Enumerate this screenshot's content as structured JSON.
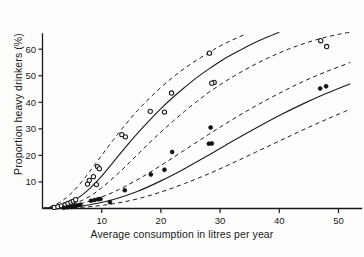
{
  "figure": {
    "xlabel": "Average consumption in litres per year",
    "ylabel": "Proportion heavy drinkers (%)",
    "caption": ""
  },
  "chart_data": {
    "type": "scatter",
    "title": "",
    "subtitle": "",
    "xlabel": "Average consumption in litres per year",
    "ylabel": "Proportion heavy drinkers (%)",
    "xlim": [
      0,
      54
    ],
    "ylim": [
      0,
      66
    ],
    "xticks": [
      10,
      20,
      30,
      40,
      50
    ],
    "yticks": [
      10,
      20,
      30,
      40,
      50,
      60
    ],
    "grid": false,
    "legend": "none",
    "axis_color": "#1a1a1a",
    "series": [
      {
        "name": "open-circles",
        "marker": "open-circle",
        "color": "#1a1a1a",
        "points": [
          [
            2.0,
            0.4
          ],
          [
            2.6,
            0.7
          ],
          [
            3.2,
            1.0
          ],
          [
            3.8,
            1.4
          ],
          [
            4.3,
            1.9
          ],
          [
            4.8,
            2.4
          ],
          [
            5.2,
            2.8
          ],
          [
            5.6,
            3.3
          ],
          [
            7.6,
            9.2
          ],
          [
            7.9,
            10.6
          ],
          [
            8.6,
            12.0
          ],
          [
            9.1,
            9.0
          ],
          [
            9.3,
            15.8
          ],
          [
            9.6,
            15.0
          ],
          [
            13.4,
            27.8
          ],
          [
            14.0,
            27.0
          ],
          [
            18.2,
            36.6
          ],
          [
            20.6,
            36.3
          ],
          [
            21.8,
            43.5
          ],
          [
            28.2,
            58.5
          ],
          [
            29.0,
            47.5
          ],
          [
            28.6,
            47.2
          ],
          [
            47.0,
            63.2
          ],
          [
            48.0,
            61.0
          ]
        ]
      },
      {
        "name": "filled-circles",
        "marker": "filled-circle",
        "color": "#111111",
        "points": [
          [
            3.6,
            0.3
          ],
          [
            4.2,
            0.5
          ],
          [
            4.8,
            0.6
          ],
          [
            5.2,
            0.8
          ],
          [
            5.6,
            1.0
          ],
          [
            6.0,
            1.2
          ],
          [
            6.4,
            1.4
          ],
          [
            8.2,
            2.9
          ],
          [
            8.8,
            3.2
          ],
          [
            9.4,
            3.5
          ],
          [
            9.8,
            3.6
          ],
          [
            11.4,
            2.4
          ],
          [
            13.9,
            6.9
          ],
          [
            18.3,
            12.8
          ],
          [
            20.6,
            14.6
          ],
          [
            21.9,
            21.3
          ],
          [
            28.1,
            24.4
          ],
          [
            28.6,
            24.5
          ],
          [
            28.4,
            30.5
          ],
          [
            46.9,
            45.2
          ],
          [
            47.9,
            46.0
          ]
        ]
      }
    ],
    "fitted_curves": [
      {
        "name": "upper-fit-solid",
        "style": "solid",
        "points": [
          [
            0,
            0
          ],
          [
            2,
            0.6
          ],
          [
            4,
            1.8
          ],
          [
            6,
            4.0
          ],
          [
            8,
            7.6
          ],
          [
            10,
            12.2
          ],
          [
            12,
            17.6
          ],
          [
            14,
            23.0
          ],
          [
            16,
            28.2
          ],
          [
            18,
            33.0
          ],
          [
            20,
            37.6
          ],
          [
            22,
            41.8
          ],
          [
            24,
            45.6
          ],
          [
            26,
            49.2
          ],
          [
            28,
            52.4
          ],
          [
            30,
            55.4
          ],
          [
            32,
            58.0
          ],
          [
            34,
            60.4
          ],
          [
            36,
            62.6
          ],
          [
            38,
            64.6
          ],
          [
            40,
            66.4
          ]
        ]
      },
      {
        "name": "upper-fit-upper-ci",
        "style": "dashed",
        "points": [
          [
            0,
            0
          ],
          [
            2,
            1.3
          ],
          [
            4,
            4.0
          ],
          [
            6,
            8.4
          ],
          [
            8,
            14.0
          ],
          [
            10,
            20.0
          ],
          [
            12,
            26.0
          ],
          [
            14,
            31.6
          ],
          [
            16,
            36.8
          ],
          [
            18,
            41.4
          ],
          [
            20,
            45.6
          ],
          [
            22,
            49.4
          ],
          [
            24,
            52.8
          ],
          [
            26,
            55.8
          ],
          [
            28,
            58.6
          ],
          [
            30,
            61.2
          ],
          [
            32,
            63.4
          ],
          [
            34,
            65.4
          ]
        ]
      },
      {
        "name": "upper-fit-lower-ci",
        "style": "dashed",
        "points": [
          [
            0,
            0
          ],
          [
            2,
            0.3
          ],
          [
            4,
            1.0
          ],
          [
            6,
            2.4
          ],
          [
            8,
            4.6
          ],
          [
            10,
            7.8
          ],
          [
            12,
            11.6
          ],
          [
            14,
            15.8
          ],
          [
            16,
            20.2
          ],
          [
            18,
            24.6
          ],
          [
            20,
            28.8
          ],
          [
            22,
            32.8
          ],
          [
            24,
            36.6
          ],
          [
            26,
            40.2
          ],
          [
            28,
            43.6
          ],
          [
            30,
            46.6
          ],
          [
            32,
            49.4
          ],
          [
            34,
            52.0
          ],
          [
            36,
            54.4
          ],
          [
            38,
            56.6
          ],
          [
            40,
            58.6
          ],
          [
            42,
            60.4
          ],
          [
            44,
            62.0
          ],
          [
            46,
            63.4
          ],
          [
            48,
            64.6
          ],
          [
            50,
            65.6
          ],
          [
            52,
            66.4
          ]
        ]
      },
      {
        "name": "lower-fit-solid",
        "style": "solid",
        "points": [
          [
            0,
            0
          ],
          [
            4,
            0.4
          ],
          [
            8,
            1.4
          ],
          [
            12,
            3.4
          ],
          [
            16,
            6.4
          ],
          [
            20,
            10.4
          ],
          [
            24,
            15.0
          ],
          [
            28,
            20.0
          ],
          [
            32,
            25.2
          ],
          [
            36,
            30.2
          ],
          [
            40,
            35.0
          ],
          [
            44,
            39.4
          ],
          [
            48,
            43.4
          ],
          [
            52,
            47.0
          ]
        ]
      },
      {
        "name": "lower-fit-upper-ci",
        "style": "dashed",
        "points": [
          [
            0,
            0
          ],
          [
            4,
            0.8
          ],
          [
            8,
            2.8
          ],
          [
            12,
            6.2
          ],
          [
            16,
            10.8
          ],
          [
            20,
            16.2
          ],
          [
            24,
            22.0
          ],
          [
            28,
            27.8
          ],
          [
            32,
            33.4
          ],
          [
            36,
            38.6
          ],
          [
            40,
            43.4
          ],
          [
            44,
            47.8
          ],
          [
            48,
            51.6
          ],
          [
            52,
            55.0
          ]
        ]
      },
      {
        "name": "lower-fit-lower-ci",
        "style": "dashed",
        "points": [
          [
            0,
            0
          ],
          [
            4,
            0.2
          ],
          [
            8,
            0.7
          ],
          [
            12,
            1.8
          ],
          [
            16,
            3.6
          ],
          [
            20,
            6.2
          ],
          [
            24,
            9.4
          ],
          [
            28,
            13.0
          ],
          [
            32,
            17.0
          ],
          [
            36,
            21.2
          ],
          [
            40,
            25.4
          ],
          [
            44,
            29.6
          ],
          [
            48,
            33.6
          ],
          [
            52,
            37.4
          ]
        ]
      }
    ]
  }
}
